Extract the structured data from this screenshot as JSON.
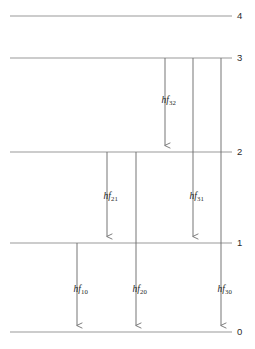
{
  "diagram": {
    "type": "energy-level-diagram",
    "canvas": {
      "width": 255,
      "height": 349
    },
    "colors": {
      "level_line": "#9a9a9a",
      "arrow_line": "#6f6f6f",
      "text": "#1d1d1d",
      "background": "#ffffff"
    },
    "levels": [
      {
        "id": "level-4",
        "label": "4",
        "y": 16,
        "x_start": 10,
        "x_end": 232,
        "label_x": 237,
        "label_y": 11
      },
      {
        "id": "level-3",
        "label": "3",
        "y": 58,
        "x_start": 10,
        "x_end": 232,
        "label_x": 237,
        "label_y": 53
      },
      {
        "id": "level-2",
        "label": "2",
        "y": 152,
        "x_start": 10,
        "x_end": 232,
        "label_x": 237,
        "label_y": 147
      },
      {
        "id": "level-1",
        "label": "1",
        "y": 243,
        "x_start": 10,
        "x_end": 232,
        "label_x": 237,
        "label_y": 238
      },
      {
        "id": "level-0",
        "label": "0",
        "y": 332,
        "x_start": 10,
        "x_end": 232,
        "label_x": 237,
        "label_y": 327
      }
    ],
    "transitions": [
      {
        "id": "transition-hf32",
        "symbol": "hf",
        "subscript": "32",
        "from_level": "3",
        "to_level": "2",
        "x": 165,
        "y_start": 58,
        "y_end": 152,
        "label_x": 176,
        "label_y": 96
      },
      {
        "id": "transition-hf21",
        "symbol": "hf",
        "subscript": "21",
        "from_level": "2",
        "to_level": "1",
        "x": 107,
        "y_start": 152,
        "y_end": 243,
        "label_x": 118,
        "label_y": 192
      },
      {
        "id": "transition-hf31",
        "symbol": "hf",
        "subscript": "31",
        "from_level": "3",
        "to_level": "1",
        "x": 193,
        "y_start": 58,
        "y_end": 243,
        "label_x": 204,
        "label_y": 192
      },
      {
        "id": "transition-hf10",
        "symbol": "hf",
        "subscript": "10",
        "from_level": "1",
        "to_level": "0",
        "x": 77,
        "y_start": 243,
        "y_end": 332,
        "label_x": 88,
        "label_y": 285
      },
      {
        "id": "transition-hf20",
        "symbol": "hf",
        "subscript": "20",
        "from_level": "2",
        "to_level": "0",
        "x": 136,
        "y_start": 152,
        "y_end": 332,
        "label_x": 147,
        "label_y": 285
      },
      {
        "id": "transition-hf30",
        "symbol": "hf",
        "subscript": "30",
        "from_level": "3",
        "to_level": "0",
        "x": 221,
        "y_start": 58,
        "y_end": 332,
        "label_x": 232,
        "label_y": 285
      }
    ]
  }
}
